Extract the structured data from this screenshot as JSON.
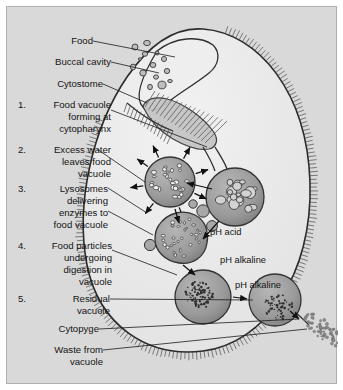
{
  "figure": {
    "type": "labeled-biological-diagram",
    "background_color": "#d9d9d9",
    "cell_fill": "#ececec",
    "vacuole_fill": "#9a9a9a",
    "membrane_color": "#2b2b2b"
  },
  "left_labels": [
    {
      "number": "",
      "lines": [
        "Food"
      ]
    },
    {
      "number": "",
      "lines": [
        "Buccal cavity"
      ]
    },
    {
      "number": "",
      "lines": [
        "Cytostome"
      ]
    },
    {
      "number": "1.",
      "lines": [
        "Food vacuole",
        "forming at",
        "cytopharynx"
      ]
    },
    {
      "number": "2.",
      "lines": [
        "Excess water",
        "leaves food",
        "vacuole"
      ]
    },
    {
      "number": "3.",
      "lines": [
        "Lysosomes",
        "delivering",
        "enzymes to",
        "food vacuole"
      ]
    },
    {
      "number": "4.",
      "lines": [
        "Food particles",
        "undergoing",
        "digestion in",
        "vacuole"
      ]
    },
    {
      "number": "5.",
      "lines": [
        "Residual",
        "vacuole"
      ]
    },
    {
      "number": "",
      "lines": [
        "Cytopyge"
      ]
    },
    {
      "number": "",
      "lines": [
        "Waste from",
        "vacuole"
      ]
    }
  ],
  "ph_annotations": [
    {
      "text": "pH acid",
      "stage": "food-vacuole-acid"
    },
    {
      "text": "pH alkaline",
      "stage": "lysosome-vacuole"
    },
    {
      "text": "pH alkaline",
      "stage": "digestion-vacuole"
    }
  ],
  "structures": [
    {
      "name": "food-particles",
      "label": "Food"
    },
    {
      "name": "buccal-cavity",
      "label": "Buccal cavity"
    },
    {
      "name": "cytostome",
      "label": "Cytostome"
    },
    {
      "name": "cytopharynx",
      "label": "Cytopharynx"
    },
    {
      "name": "forming-food-vacuole",
      "label": "Food vacuole forming at cytopharynx"
    },
    {
      "name": "water-loss-vacuole",
      "label": "Excess water leaves food vacuole"
    },
    {
      "name": "lysosome-vacuole",
      "label": "Lysosomes delivering enzymes to food vacuole"
    },
    {
      "name": "digestion-vacuole",
      "label": "Food particles undergoing digestion in vacuole"
    },
    {
      "name": "residual-vacuole",
      "label": "Residual vacuole"
    },
    {
      "name": "cytopyge",
      "label": "Cytopyge"
    },
    {
      "name": "waste-particles",
      "label": "Waste from vacuole"
    },
    {
      "name": "cilia",
      "label": "Cilia"
    }
  ]
}
